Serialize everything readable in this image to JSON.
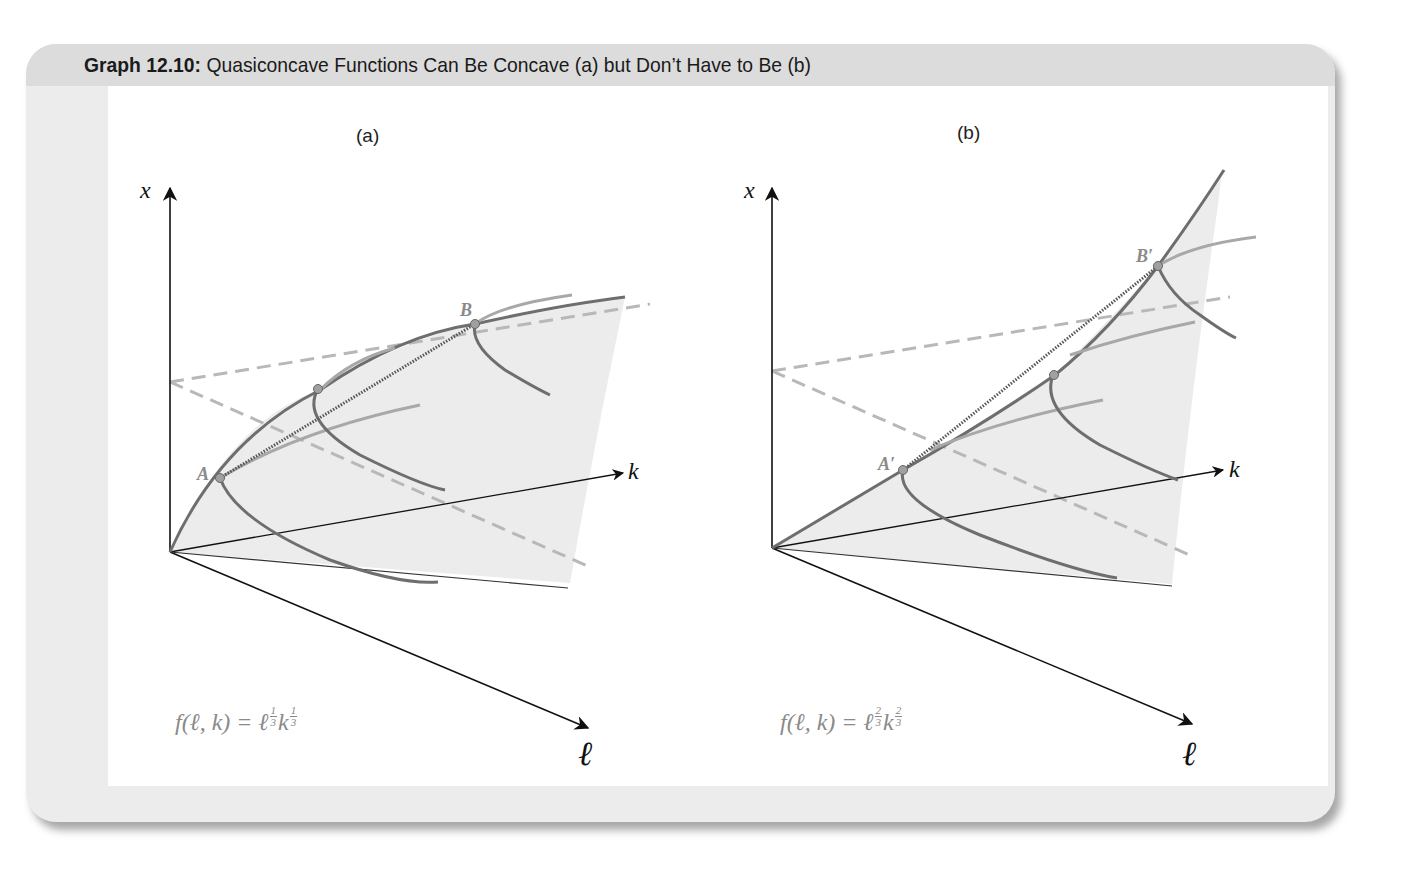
{
  "header": {
    "title_bold": "Graph 12.10:",
    "title_rest": " Quasiconcave Functions Can Be Concave (a) but Don’t Have to Be (b)"
  },
  "panels": [
    {
      "label": "(a)",
      "axes": {
        "vertical": "x",
        "right": "k",
        "down": "ℓ"
      },
      "points": [
        {
          "label": "A"
        },
        {
          "label": ""
        },
        {
          "label": "B"
        }
      ],
      "formula": {
        "lhs": "f(ℓ, k) = ℓ",
        "exp1_num": "1",
        "exp1_den": "3",
        "base2": "k",
        "exp2_num": "1",
        "exp2_den": "3"
      },
      "shape": "concave"
    },
    {
      "label": "(b)",
      "axes": {
        "vertical": "x",
        "right": "k",
        "down": "ℓ"
      },
      "points": [
        {
          "label": "A′"
        },
        {
          "label": ""
        },
        {
          "label": "B′"
        }
      ],
      "formula": {
        "lhs": "f(ℓ, k) = ℓ",
        "exp1_num": "2",
        "exp1_den": "3",
        "base2": "k",
        "exp2_num": "2",
        "exp2_den": "3"
      },
      "shape": "convex"
    }
  ],
  "colors": {
    "frame_bg": "#ececec",
    "title_bar": "#dcdcdc",
    "surface_fill": "#ececec",
    "curve_dark": "#6e6e6e",
    "curve_light": "#a8a8a8",
    "dashed": "#b8b8b8",
    "axis": "#111111",
    "point_fill": "#a0a0a0"
  }
}
